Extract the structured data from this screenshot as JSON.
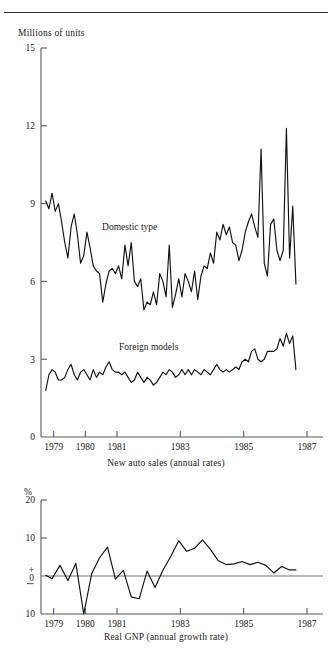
{
  "figure": {
    "top_rule": true
  },
  "panels": {
    "auto_sales": {
      "y_axis_title": "Millions of units",
      "caption": "New auto sales (annual rates)",
      "y_ticks": [
        "15",
        "12",
        "9",
        "6",
        "3",
        "0"
      ],
      "x_ticks": [
        "1979",
        "1980",
        "1981",
        "1983",
        "1985",
        "1987"
      ],
      "series_labels": {
        "domestic": "Domestic type",
        "foreign": "Foreign models"
      }
    },
    "real_gnp": {
      "y_axis_title": "%",
      "caption": "Real GNP (annual growth rate)",
      "y_ticks": [
        "20",
        "10",
        "+",
        "0",
        "10"
      ],
      "x_ticks": [
        "1979",
        "1980",
        "1981",
        "1983",
        "1985",
        "1987"
      ]
    }
  },
  "chart_data": [
    {
      "type": "line",
      "title": "New auto sales (annual rates)",
      "xlabel": "",
      "ylabel": "Millions of units",
      "ylim": [
        0,
        15
      ],
      "xlim": [
        1978.6,
        1987.0
      ],
      "yticks": [
        0,
        3,
        6,
        9,
        12,
        15
      ],
      "xticks": [
        1979,
        1980,
        1981,
        1983,
        1985,
        1987
      ],
      "grid": false,
      "legend": "inline-annotations",
      "annotations": [
        {
          "text": "Domestic type",
          "x": 1981.4,
          "y": 8.0
        },
        {
          "text": "Foreign models",
          "x": 1982.0,
          "y": 3.35
        }
      ],
      "x": [
        1978.75,
        1978.85,
        1978.95,
        1979.05,
        1979.15,
        1979.25,
        1979.35,
        1979.45,
        1979.55,
        1979.65,
        1979.75,
        1979.85,
        1979.95,
        1980.05,
        1980.15,
        1980.25,
        1980.35,
        1980.45,
        1980.55,
        1980.65,
        1980.75,
        1980.85,
        1980.95,
        1981.05,
        1981.15,
        1981.25,
        1981.35,
        1981.45,
        1981.55,
        1981.65,
        1981.75,
        1981.85,
        1981.95,
        1982.05,
        1982.15,
        1982.25,
        1982.35,
        1982.45,
        1982.55,
        1982.65,
        1982.75,
        1982.85,
        1982.95,
        1983.05,
        1983.15,
        1983.25,
        1983.35,
        1983.45,
        1983.55,
        1983.65,
        1983.75,
        1983.85,
        1983.95,
        1984.05,
        1984.15,
        1984.25,
        1984.35,
        1984.45,
        1984.55,
        1984.65,
        1984.75,
        1984.85,
        1984.95,
        1985.05,
        1985.15,
        1985.25,
        1985.35,
        1985.45,
        1985.55,
        1985.65,
        1985.75,
        1985.85,
        1985.95,
        1986.05,
        1986.15,
        1986.25,
        1986.35,
        1986.45,
        1986.55,
        1986.65
      ],
      "series": [
        {
          "name": "Domestic type",
          "values": [
            9.1,
            8.8,
            9.4,
            8.7,
            9.0,
            8.3,
            7.5,
            6.9,
            8.1,
            8.6,
            7.8,
            6.7,
            7.0,
            7.9,
            7.3,
            6.6,
            6.4,
            6.3,
            5.2,
            5.9,
            6.4,
            6.5,
            6.3,
            6.6,
            6.1,
            7.4,
            6.6,
            7.5,
            6.0,
            5.8,
            6.1,
            4.9,
            5.2,
            5.1,
            5.6,
            5.1,
            6.3,
            6.0,
            5.4,
            7.4,
            5.0,
            5.5,
            6.1,
            5.4,
            6.3,
            6.0,
            5.6,
            6.4,
            5.3,
            6.2,
            6.6,
            6.5,
            7.1,
            6.7,
            7.9,
            7.6,
            8.2,
            7.8,
            8.1,
            7.5,
            7.4,
            6.8,
            7.2,
            7.9,
            8.3,
            8.6,
            8.1,
            7.7,
            11.1,
            6.7,
            6.2,
            8.2,
            8.4,
            7.2,
            6.8,
            7.2,
            11.9,
            6.9,
            8.9,
            5.9
          ]
        },
        {
          "name": "Foreign models",
          "values": [
            1.8,
            2.4,
            2.6,
            2.5,
            2.2,
            2.2,
            2.3,
            2.6,
            2.8,
            2.4,
            2.2,
            2.5,
            2.6,
            2.4,
            2.2,
            2.6,
            2.3,
            2.5,
            2.4,
            2.7,
            2.9,
            2.6,
            2.5,
            2.5,
            2.4,
            2.5,
            2.3,
            2.1,
            2.2,
            2.5,
            2.3,
            2.1,
            2.3,
            2.2,
            2.0,
            2.1,
            2.3,
            2.5,
            2.4,
            2.6,
            2.5,
            2.3,
            2.4,
            2.6,
            2.4,
            2.6,
            2.4,
            2.6,
            2.5,
            2.4,
            2.6,
            2.5,
            2.4,
            2.6,
            2.8,
            2.6,
            2.5,
            2.6,
            2.5,
            2.6,
            2.7,
            2.6,
            2.9,
            3.0,
            2.9,
            3.3,
            3.4,
            3.0,
            2.9,
            3.0,
            3.3,
            3.3,
            3.3,
            3.4,
            3.8,
            3.5,
            4.0,
            3.6,
            3.9,
            2.6
          ]
        }
      ]
    },
    {
      "type": "line",
      "title": "Real GNP (annual growth rate)",
      "xlabel": "",
      "ylabel": "%",
      "ylim": [
        -10,
        20
      ],
      "xlim": [
        1978.6,
        1987.0
      ],
      "yticks": [
        -10,
        0,
        10,
        20
      ],
      "ytick_labels": [
        "10",
        "0",
        "10",
        "20"
      ],
      "xticks": [
        1979,
        1980,
        1981,
        1983,
        1985,
        1987
      ],
      "grid": false,
      "zero_reference_line": 0,
      "x": [
        1978.75,
        1978.95,
        1979.2,
        1979.45,
        1979.7,
        1979.95,
        1980.2,
        1980.45,
        1980.7,
        1980.95,
        1981.2,
        1981.45,
        1981.7,
        1981.95,
        1982.2,
        1982.45,
        1982.7,
        1982.95,
        1983.2,
        1983.45,
        1983.7,
        1983.95,
        1984.2,
        1984.45,
        1984.7,
        1984.95,
        1985.2,
        1985.45,
        1985.7,
        1985.95,
        1986.2,
        1986.45,
        1986.65
      ],
      "series": [
        {
          "name": "Real GNP growth",
          "values": [
            0.2,
            -0.7,
            2.8,
            -1.2,
            3.3,
            -10.0,
            0.6,
            4.8,
            7.6,
            -0.8,
            1.5,
            -5.5,
            -6.0,
            1.3,
            -3.0,
            1.5,
            5.2,
            9.3,
            6.5,
            7.3,
            9.5,
            7.0,
            4.0,
            3.0,
            3.2,
            3.8,
            3.0,
            3.6,
            2.8,
            0.8,
            2.5,
            1.6,
            1.6
          ]
        }
      ]
    }
  ]
}
